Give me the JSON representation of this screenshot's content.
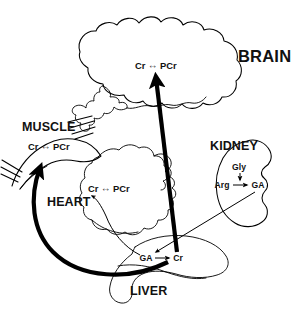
{
  "figure": {
    "background_color": "#ffffff",
    "ink_color": "#000000"
  },
  "organs": {
    "brain": {
      "label": "BRAIN",
      "reaction": "Cr ⇔ PCr"
    },
    "muscle": {
      "label": "MUSCLE",
      "reaction": "Cr ⇔ PCr"
    },
    "heart": {
      "label": "HEART",
      "reaction": "Cr ⇔ PCr"
    },
    "kidney": {
      "label": "KIDNEY",
      "substrate_top": "Gly",
      "substrate_left": "Arg",
      "product": "GA",
      "arrow_down": "↓",
      "arrow_right": "→"
    },
    "liver": {
      "label": "LIVER",
      "substrate": "GA",
      "arrow_right": "→",
      "product": "Cr"
    }
  },
  "transport_arrows": {
    "liver_to_brain": "Cr transport from liver to brain",
    "liver_to_muscle": "Cr transport from liver to muscle",
    "liver_to_heart": "Cr transport from liver to heart",
    "kidney_to_liver": "GA transport from kidney to liver"
  }
}
